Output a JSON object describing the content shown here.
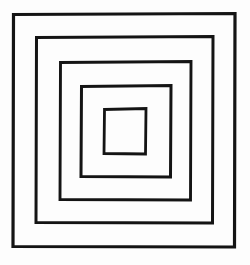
{
  "figure": {
    "background_color": "#fdfdfd",
    "stroke_color": "#141414",
    "canvas": {
      "width": 250,
      "height": 265
    },
    "shape_count": 5,
    "shape_type": "square-outline",
    "squares": [
      {
        "name": "square-1-outermost",
        "index": 1,
        "x": 12,
        "y": 13,
        "width": 224,
        "height": 235,
        "stroke_width": 3.2,
        "points": "13.5,14.5 235,13.5 234.5,247 13,246.5 13.5,14.5"
      },
      {
        "name": "square-2",
        "index": 2,
        "x": 35,
        "y": 36,
        "width": 179,
        "height": 188,
        "stroke_width": 3.0,
        "points": "36.5,37.5 213,36.5 212.5,223 36,222.5 36.5,37.5"
      },
      {
        "name": "square-3",
        "index": 3,
        "x": 59,
        "y": 61,
        "width": 133,
        "height": 140,
        "stroke_width": 2.9,
        "points": "60.5,62.5 191,61.5 190.5,200 60,199.5 60.5,62.5"
      },
      {
        "name": "square-4",
        "index": 4,
        "x": 80,
        "y": 85,
        "width": 92,
        "height": 93,
        "stroke_width": 3.0,
        "points": "81.5,86.5 171,85.5 170.5,177 81,176.5 81.5,86.5"
      },
      {
        "name": "square-5-innermost",
        "index": 5,
        "x": 103,
        "y": 108,
        "width": 44,
        "height": 47,
        "stroke_width": 2.8,
        "points": "104.5,109.5 146,108.5 145.5,154 104,153.5 104.5,109.5"
      }
    ]
  }
}
